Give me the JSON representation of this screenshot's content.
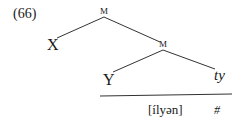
{
  "example": {
    "number": "(66)",
    "nodes": {
      "root": "M",
      "left_leaf": "X",
      "inner": "M",
      "inner_left_leaf": "Y",
      "inner_right_leaf": "ty"
    },
    "phonetic_form": "[ílyən]",
    "boundary": "#"
  }
}
